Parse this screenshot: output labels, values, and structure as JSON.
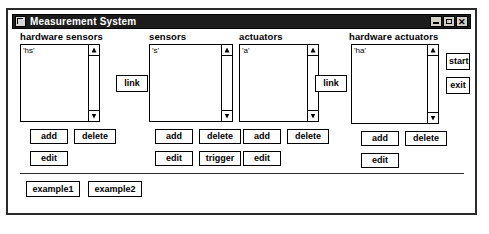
{
  "window": {
    "title": "Measurement System",
    "icon": "app-window-icon",
    "controls": {
      "minimize": "minimize-icon",
      "maximize": "maximize-icon",
      "close": "✕"
    }
  },
  "columns": [
    {
      "id": "hardware-sensors",
      "header": "hardware sensors",
      "list_items": [
        "'hs'"
      ],
      "scrollbar": {
        "up": "scroll-up-arrow",
        "down": "scroll-down-arrow"
      },
      "buttons": [
        {
          "id": "add",
          "label": "add"
        },
        {
          "id": "delete",
          "label": "delete"
        },
        {
          "id": "edit",
          "label": "edit"
        }
      ]
    },
    {
      "id": "sensors",
      "header": "sensors",
      "list_items": [
        "'s'"
      ],
      "scrollbar": {
        "up": "scroll-up-arrow",
        "down": "scroll-down-arrow"
      },
      "buttons": [
        {
          "id": "add",
          "label": "add"
        },
        {
          "id": "delete",
          "label": "delete"
        },
        {
          "id": "edit",
          "label": "edit"
        },
        {
          "id": "trigger",
          "label": "trigger"
        }
      ]
    },
    {
      "id": "actuators",
      "header": "actuators",
      "list_items": [
        "'a'"
      ],
      "scrollbar": {
        "up": "scroll-up-arrow",
        "down": "scroll-down-arrow"
      },
      "buttons": [
        {
          "id": "add",
          "label": "add"
        },
        {
          "id": "delete",
          "label": "delete"
        },
        {
          "id": "edit",
          "label": "edit"
        }
      ]
    },
    {
      "id": "hardware-actuators",
      "header": "hardware actuators",
      "list_items": [
        "'ha'"
      ],
      "scrollbar": {
        "up": "scroll-up-arrow",
        "down": "scroll-down-arrow"
      },
      "buttons": [
        {
          "id": "add",
          "label": "add"
        },
        {
          "id": "delete",
          "label": "delete"
        },
        {
          "id": "edit",
          "label": "edit"
        }
      ]
    }
  ],
  "link_buttons": [
    {
      "id": "link-hardware-sensors-sensors",
      "label": "link"
    },
    {
      "id": "link-actuators-hardware-actuators",
      "label": "link"
    }
  ],
  "side_buttons": [
    {
      "id": "start",
      "label": "start"
    },
    {
      "id": "exit",
      "label": "exit"
    }
  ],
  "example_buttons": [
    {
      "id": "example1",
      "label": "example1"
    },
    {
      "id": "example2",
      "label": "example2"
    }
  ],
  "colors": {
    "titlebar_bg": "#1c1c1c",
    "titlebar_text": "#ffffff",
    "window_bg": "#ffffff",
    "border": "#2b2b2b",
    "control_face": "#d4d0c8"
  }
}
